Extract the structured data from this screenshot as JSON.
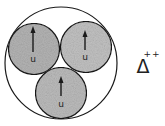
{
  "diagram": {
    "particle": {
      "symbol": "Δ",
      "charge": "++"
    },
    "quarks": [
      {
        "flavor": "u",
        "spin": "up"
      },
      {
        "flavor": "u",
        "spin": "up"
      },
      {
        "flavor": "u",
        "spin": "up"
      }
    ],
    "colors": {
      "quark_fill": "#b8b8b8",
      "stroke": "#1a1a1a",
      "background": "#ffffff"
    }
  }
}
